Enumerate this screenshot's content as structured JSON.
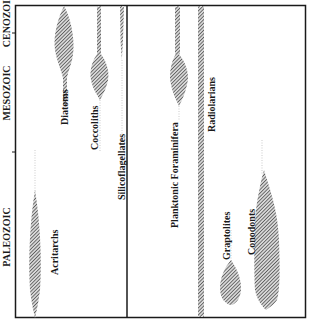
{
  "diagram": {
    "type": "stratigraphic-range-chart",
    "axis": {
      "eras": [
        {
          "label": "CENOZOIC"
        },
        {
          "label": "MESOZOIC"
        },
        {
          "label": "PALEOZOIC"
        }
      ]
    },
    "panels": [
      {
        "name": "left-panel",
        "taxa": [
          {
            "label": "Acritarchs"
          },
          {
            "label": "Diatoms"
          },
          {
            "label": "Coccoliths"
          },
          {
            "label": "Silicoflagellates"
          }
        ]
      },
      {
        "name": "right-panel",
        "taxa": [
          {
            "label": "Planktonic Foraminifera"
          },
          {
            "label": "Radiolarians"
          },
          {
            "label": "Graptolites"
          },
          {
            "label": "Conodonts"
          }
        ]
      }
    ],
    "colors": {
      "frame": "#1a1a1a",
      "fill_hatch": "#555555",
      "background": "#ffffff"
    }
  }
}
